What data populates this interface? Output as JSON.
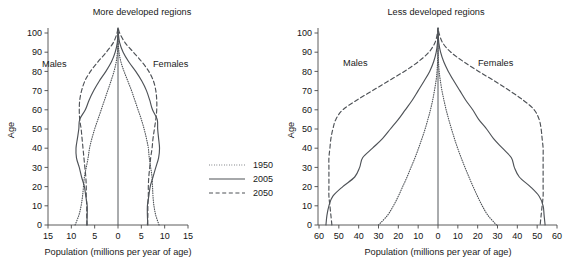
{
  "figure": {
    "kind": "population-pyramid-pair",
    "background": "#ffffff",
    "line_color": "#4e5257"
  },
  "legend": {
    "position": "between-panels-lower",
    "entries": [
      {
        "label": "1950",
        "style": "dotted"
      },
      {
        "label": "2005",
        "style": "solid"
      },
      {
        "label": "2050",
        "style": "dashed"
      }
    ]
  },
  "panels": {
    "left": {
      "title": "More developed regions",
      "y_axis_label": "Age",
      "x_axis_label": "Population (millions per year of age)",
      "male_label": "Males",
      "female_label": "Females",
      "x_ticks": [
        "15",
        "10",
        "5",
        "0",
        "5",
        "10",
        "15"
      ],
      "y_ticks": [
        "0",
        "10",
        "20",
        "30",
        "40",
        "50",
        "60",
        "70",
        "80",
        "90",
        "100"
      ]
    },
    "right": {
      "title": "Less developed regions",
      "y_axis_label": "Age",
      "x_axis_label": "Population (millions per year of age)",
      "male_label": "Males",
      "female_label": "Females",
      "x_ticks": [
        "60",
        "50",
        "40",
        "30",
        "20",
        "10",
        "0",
        "10",
        "20",
        "30",
        "40",
        "50",
        "60"
      ],
      "y_ticks": [
        "0",
        "10",
        "20",
        "30",
        "40",
        "50",
        "60",
        "70",
        "80",
        "90",
        "100"
      ]
    }
  },
  "chart_data": {
    "type": "line",
    "xlabel": "Population (millions per year of age)",
    "ylabel": "Age",
    "grid": false,
    "legend_position": "center",
    "ages": [
      0,
      5,
      10,
      15,
      20,
      25,
      30,
      35,
      40,
      45,
      50,
      55,
      60,
      65,
      70,
      75,
      80,
      85,
      90,
      95,
      100
    ],
    "panels": [
      {
        "name": "More developed regions",
        "xlim": [
          -15,
          15
        ],
        "ylim": [
          0,
          105
        ],
        "x_ticks": [
          -15,
          -10,
          -5,
          0,
          5,
          10,
          15
        ],
        "x_tick_labels": [
          "15",
          "10",
          "5",
          "0",
          "5",
          "10",
          "15"
        ],
        "y_ticks": [
          0,
          10,
          20,
          30,
          40,
          50,
          60,
          70,
          80,
          90,
          100
        ],
        "series": [
          {
            "name": "1950",
            "style": "dotted",
            "males": [
              9.2,
              8.4,
              7.9,
              7.6,
              7.4,
              7.2,
              6.8,
              6.4,
              6.1,
              5.6,
              5.0,
              4.3,
              3.6,
              2.9,
              2.2,
              1.5,
              0.85,
              0.38,
              0.12,
              0.03,
              0.0
            ],
            "females": [
              8.8,
              8.1,
              7.7,
              7.5,
              7.4,
              7.3,
              7.0,
              6.7,
              6.5,
              6.1,
              5.6,
              5.0,
              4.3,
              3.6,
              2.9,
              2.1,
              1.3,
              0.62,
              0.22,
              0.05,
              0.0
            ]
          },
          {
            "name": "2005",
            "style": "solid",
            "males": [
              6.7,
              6.6,
              6.6,
              6.9,
              7.2,
              7.8,
              8.3,
              8.9,
              9.0,
              8.7,
              8.4,
              8.2,
              7.0,
              6.2,
              5.2,
              4.0,
              2.6,
              1.4,
              0.6,
              0.15,
              0.02
            ],
            "females": [
              6.4,
              6.3,
              6.3,
              6.6,
              6.9,
              7.5,
              8.1,
              8.7,
              8.9,
              8.7,
              8.5,
              8.4,
              7.4,
              6.8,
              6.1,
              5.1,
              3.8,
              2.3,
              1.1,
              0.35,
              0.06
            ]
          },
          {
            "name": "2050",
            "style": "dashed",
            "males": [
              6.6,
              6.7,
              6.7,
              6.8,
              6.8,
              6.9,
              7.1,
              7.3,
              7.5,
              7.7,
              7.9,
              8.2,
              8.3,
              8.2,
              7.8,
              7.1,
              5.9,
              4.3,
              2.5,
              1.0,
              0.2
            ],
            "females": [
              6.3,
              6.4,
              6.4,
              6.5,
              6.5,
              6.6,
              6.8,
              7.0,
              7.3,
              7.5,
              7.8,
              8.1,
              8.3,
              8.3,
              8.1,
              7.6,
              6.6,
              5.1,
              3.3,
              1.5,
              0.35
            ]
          }
        ]
      },
      {
        "name": "Less developed regions",
        "xlim": [
          -60,
          60
        ],
        "ylim": [
          0,
          105
        ],
        "x_ticks": [
          -60,
          -50,
          -40,
          -30,
          -20,
          -10,
          0,
          10,
          20,
          30,
          40,
          50,
          60
        ],
        "x_tick_labels": [
          "60",
          "50",
          "40",
          "30",
          "20",
          "10",
          "0",
          "10",
          "20",
          "30",
          "40",
          "50",
          "60"
        ],
        "y_ticks": [
          0,
          10,
          20,
          30,
          40,
          50,
          60,
          70,
          80,
          90,
          100
        ],
        "series": [
          {
            "name": "1950",
            "style": "dotted",
            "males": [
              30.0,
              25.5,
              22.5,
              20.0,
              17.8,
              15.6,
              13.6,
              11.6,
              9.8,
              8.1,
              6.5,
              5.1,
              3.8,
              2.7,
              1.8,
              1.0,
              0.5,
              0.2,
              0.06,
              0.01,
              0.0
            ],
            "females": [
              29.5,
              25.2,
              22.3,
              19.9,
              17.7,
              15.6,
              13.6,
              11.7,
              9.9,
              8.3,
              6.8,
              5.4,
              4.1,
              3.0,
              2.0,
              1.2,
              0.6,
              0.25,
              0.08,
              0.01,
              0.0
            ]
          },
          {
            "name": "2005",
            "style": "solid",
            "males": [
              56.5,
              56.0,
              55.0,
              53.0,
              48.0,
              42.0,
              39.5,
              38.0,
              33.0,
              28.0,
              24.0,
              20.0,
              16.5,
              13.0,
              10.0,
              7.0,
              4.2,
              2.2,
              0.9,
              0.25,
              0.04
            ],
            "females": [
              54.0,
              53.5,
              53.0,
              51.0,
              46.5,
              41.0,
              38.5,
              37.0,
              32.5,
              28.0,
              24.5,
              20.5,
              17.5,
              14.0,
              11.0,
              8.0,
              5.2,
              2.9,
              1.3,
              0.4,
              0.07
            ]
          },
          {
            "name": "2050",
            "style": "dashed",
            "males": [
              53.5,
              54.0,
              54.5,
              55.0,
              55.0,
              55.0,
              55.0,
              55.0,
              54.5,
              54.0,
              53.0,
              51.5,
              48.0,
              41.0,
              33.0,
              25.0,
              17.0,
              10.0,
              4.6,
              1.5,
              0.3
            ],
            "females": [
              51.5,
              52.0,
              52.5,
              53.0,
              53.0,
              53.0,
              53.0,
              53.0,
              53.0,
              52.5,
              52.0,
              51.0,
              48.5,
              43.0,
              36.0,
              28.5,
              20.5,
              13.0,
              6.5,
              2.3,
              0.5
            ]
          }
        ]
      }
    ]
  }
}
